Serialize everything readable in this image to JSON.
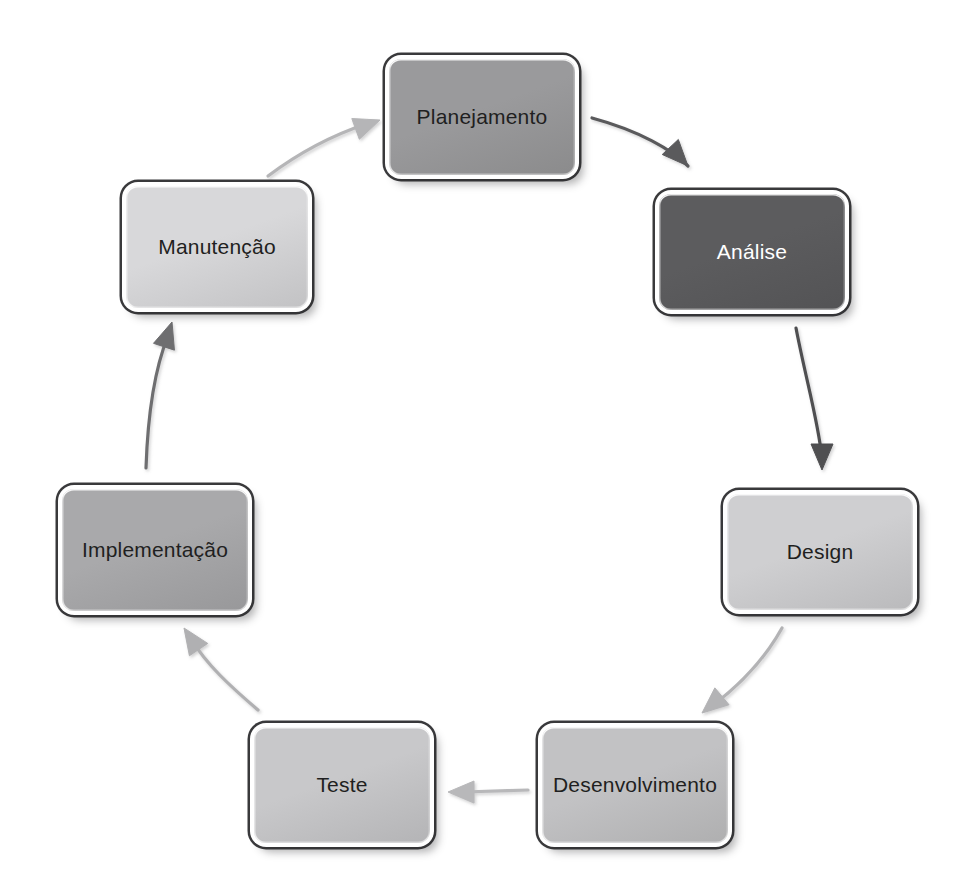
{
  "diagram": {
    "type": "circular-cycle",
    "background_color": "#ffffff",
    "nodes": [
      {
        "id": "planejamento",
        "label": "Planejamento",
        "fill_color": "#9a9a9c",
        "text_color": "#1f1f21",
        "border_color": "#2b2b2d",
        "x": 385,
        "y": 55,
        "width": 194,
        "height": 124,
        "font_size": 21
      },
      {
        "id": "analise",
        "label": "Análise",
        "fill_color": "#5c5c5e",
        "text_color": "#ffffff",
        "border_color": "#2b2b2d",
        "x": 655,
        "y": 190,
        "width": 194,
        "height": 124,
        "font_size": 21
      },
      {
        "id": "design",
        "label": "Design",
        "fill_color": "#cfcfd1",
        "text_color": "#1f1f21",
        "border_color": "#2b2b2d",
        "x": 723,
        "y": 490,
        "width": 194,
        "height": 124,
        "font_size": 21
      },
      {
        "id": "desenvolvimento",
        "label": "Desenvolvimento",
        "fill_color": "#c2c2c4",
        "text_color": "#1f1f21",
        "border_color": "#2b2b2d",
        "x": 538,
        "y": 723,
        "width": 194,
        "height": 124,
        "font_size": 21
      },
      {
        "id": "teste",
        "label": "Teste",
        "fill_color": "#c8c8ca",
        "text_color": "#1f1f21",
        "border_color": "#2b2b2d",
        "x": 250,
        "y": 723,
        "width": 184,
        "height": 124,
        "font_size": 21
      },
      {
        "id": "implementacao",
        "label": "Implementação",
        "fill_color": "#a9a9ab",
        "text_color": "#1f1f21",
        "border_color": "#2b2b2d",
        "x": 58,
        "y": 485,
        "width": 194,
        "height": 130,
        "font_size": 21
      },
      {
        "id": "manutencao",
        "label": "Manutenção",
        "fill_color": "#d8d8da",
        "text_color": "#1f1f21",
        "border_color": "#2b2b2d",
        "x": 122,
        "y": 182,
        "width": 190,
        "height": 130,
        "font_size": 21
      }
    ],
    "arrows": [
      {
        "id": "arrow-planejamento-analise",
        "from": "planejamento",
        "to": "analise",
        "color": "#5a5a5c",
        "stroke_width": 3.2,
        "path": "M 592 118 C 640 131 672 150 688 166",
        "head": "M 688 166 L 669 168 L 679 186 Z",
        "head_angle": 47
      },
      {
        "id": "arrow-analise-design",
        "from": "analise",
        "to": "design",
        "color": "#4f4f51",
        "stroke_width": 3.2,
        "path": "M 796 328 C 806 380 818 420 822 458",
        "head": "M 822 470 L 809 449 L 835 449 Z",
        "head_angle": 90
      },
      {
        "id": "arrow-design-desenvolvimento",
        "from": "design",
        "to": "desenvolvimento",
        "color": "#b3b3b5",
        "stroke_width": 3.2,
        "path": "M 782 628 C 762 664 736 688 712 706",
        "head": "M 702 713 L 716 694 L 726 712 Z",
        "head_angle": 140
      },
      {
        "id": "arrow-desenvolvimento-teste",
        "from": "desenvolvimento",
        "to": "teste",
        "color": "#b8b8ba",
        "stroke_width": 3.2,
        "path": "M 528 790 L 464 792",
        "head": "M 448 792 L 469 781 L 469 803 Z",
        "head_angle": 180
      },
      {
        "id": "arrow-teste-implementacao",
        "from": "teste",
        "to": "implementacao",
        "color": "#b0b0b2",
        "stroke_width": 3.2,
        "path": "M 258 710 C 230 686 206 664 192 640",
        "head": "M 184 628 L 204 634 L 188 648 Z",
        "head_angle": 236
      },
      {
        "id": "arrow-implementacao-manutencao",
        "from": "implementacao",
        "to": "manutencao",
        "color": "#6e6e70",
        "stroke_width": 3.2,
        "path": "M 146 468 C 148 408 155 368 168 336",
        "head": "M 172 322 L 180 342 L 158 342 Z",
        "head_angle": 288
      },
      {
        "id": "arrow-manutencao-planejamento",
        "from": "manutencao",
        "to": "planejamento",
        "color": "#b5b5b7",
        "stroke_width": 3.2,
        "path": "M 268 176 C 300 152 336 134 366 124",
        "head": "M 380 120 L 363 131 L 358 110 Z",
        "head_angle": 340
      }
    ]
  }
}
